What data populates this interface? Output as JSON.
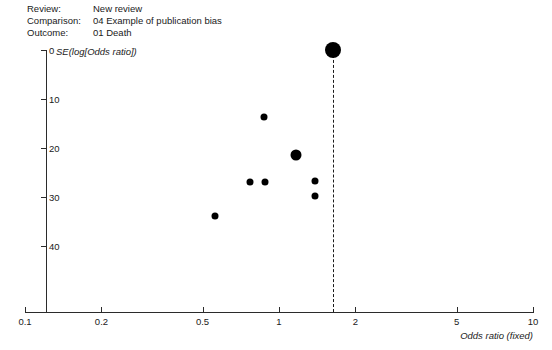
{
  "header": {
    "rows": [
      {
        "label": "Review:",
        "value": "New review"
      },
      {
        "label": "Comparison:",
        "value": "04 Example of publication bias"
      },
      {
        "label": "Outcome:",
        "value": "01 Death"
      }
    ]
  },
  "chart_data": {
    "type": "scatter",
    "title": "",
    "subtitle": "",
    "xlabel": "Odds ratio (fixed)",
    "ylabel": "SE(log[Odds ratio])",
    "xscale": "log",
    "yscale": "linear",
    "y_inverted": true,
    "xlim": [
      0.1,
      10
    ],
    "ylim": [
      0,
      45
    ],
    "xticks": [
      0.1,
      0.2,
      0.5,
      1,
      2,
      5,
      10
    ],
    "xtick_labels": [
      "0.1",
      "0.2",
      "0.5",
      "1",
      "2",
      "5",
      "10"
    ],
    "yticks": [
      0,
      10,
      20,
      30,
      40
    ],
    "ytick_labels": [
      "0",
      "10",
      "20",
      "30",
      "40"
    ],
    "grid": false,
    "legend": null,
    "reference_line": {
      "orientation": "vertical",
      "value": 1.63,
      "style": "dashed",
      "color": "#1a1a1a"
    },
    "points": [
      {
        "x": 1.63,
        "y": 0.0,
        "size": "large",
        "size_px": 16
      },
      {
        "x": 0.87,
        "y": 13.7,
        "size": "small",
        "size_px": 7
      },
      {
        "x": 1.17,
        "y": 21.4,
        "size": "medium",
        "size_px": 11
      },
      {
        "x": 0.77,
        "y": 26.9,
        "size": "small",
        "size_px": 7
      },
      {
        "x": 0.88,
        "y": 26.9,
        "size": "small",
        "size_px": 7
      },
      {
        "x": 1.39,
        "y": 26.7,
        "size": "small",
        "size_px": 7
      },
      {
        "x": 1.39,
        "y": 29.8,
        "size": "small",
        "size_px": 7
      },
      {
        "x": 0.56,
        "y": 33.9,
        "size": "small",
        "size_px": 7
      }
    ],
    "colors": {
      "marker": "#000000",
      "axis": "#2b2b2b",
      "text": "#1a1a1a"
    }
  }
}
